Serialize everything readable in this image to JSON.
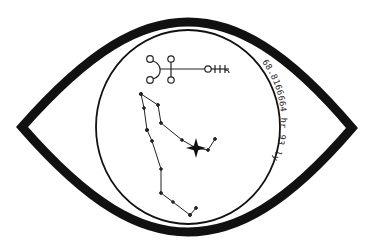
{
  "canvas": {
    "width": 377,
    "height": 251,
    "background": "#ffffff"
  },
  "colors": {
    "ink": "#111111",
    "text": "#222222"
  },
  "eye": {
    "left_point": [
      22,
      127
    ],
    "right_point": [
      352,
      128
    ],
    "top_y": 22,
    "bottom_y": 232,
    "stroke_width": 9
  },
  "iris": {
    "cx": 188,
    "cy": 127,
    "rx": 92,
    "ry": 97,
    "stroke_width": 1.8
  },
  "arc_label": {
    "text": "68.8166664 hr 93 ly"
  },
  "sigil": {
    "crescent_circles": [
      [
        150,
        59
      ],
      [
        150,
        80
      ]
    ],
    "cross_circles": [
      [
        171,
        59
      ],
      [
        171,
        80
      ]
    ],
    "end_circle": [
      208,
      69
    ],
    "ticks_x": [
      215,
      220,
      225
    ]
  },
  "constellation": {
    "stars": [
      [
        141,
        94
      ],
      [
        144,
        108
      ],
      [
        147,
        130
      ],
      [
        152,
        141
      ],
      [
        161,
        169
      ],
      [
        161,
        193
      ],
      [
        173,
        202
      ],
      [
        190,
        215
      ],
      [
        196,
        208
      ],
      [
        158,
        105
      ],
      [
        161,
        123
      ],
      [
        182,
        140
      ],
      [
        208,
        150
      ],
      [
        215,
        139
      ]
    ],
    "bright_star": [
      196,
      148
    ],
    "lines": [
      [
        [
          141,
          94
        ],
        [
          144,
          108
        ]
      ],
      [
        [
          144,
          108
        ],
        [
          147,
          130
        ]
      ],
      [
        [
          147,
          130
        ],
        [
          152,
          141
        ]
      ],
      [
        [
          152,
          141
        ],
        [
          161,
          169
        ]
      ],
      [
        [
          161,
          169
        ],
        [
          161,
          193
        ]
      ],
      [
        [
          161,
          193
        ],
        [
          173,
          202
        ]
      ],
      [
        [
          173,
          202
        ],
        [
          190,
          215
        ]
      ],
      [
        [
          190,
          215
        ],
        [
          196,
          208
        ]
      ],
      [
        [
          141,
          94
        ],
        [
          158,
          105
        ]
      ],
      [
        [
          158,
          105
        ],
        [
          161,
          123
        ]
      ],
      [
        [
          161,
          123
        ],
        [
          182,
          140
        ]
      ],
      [
        [
          182,
          140
        ],
        [
          196,
          148
        ]
      ],
      [
        [
          196,
          148
        ],
        [
          208,
          150
        ]
      ],
      [
        [
          208,
          150
        ],
        [
          215,
          139
        ]
      ]
    ]
  }
}
